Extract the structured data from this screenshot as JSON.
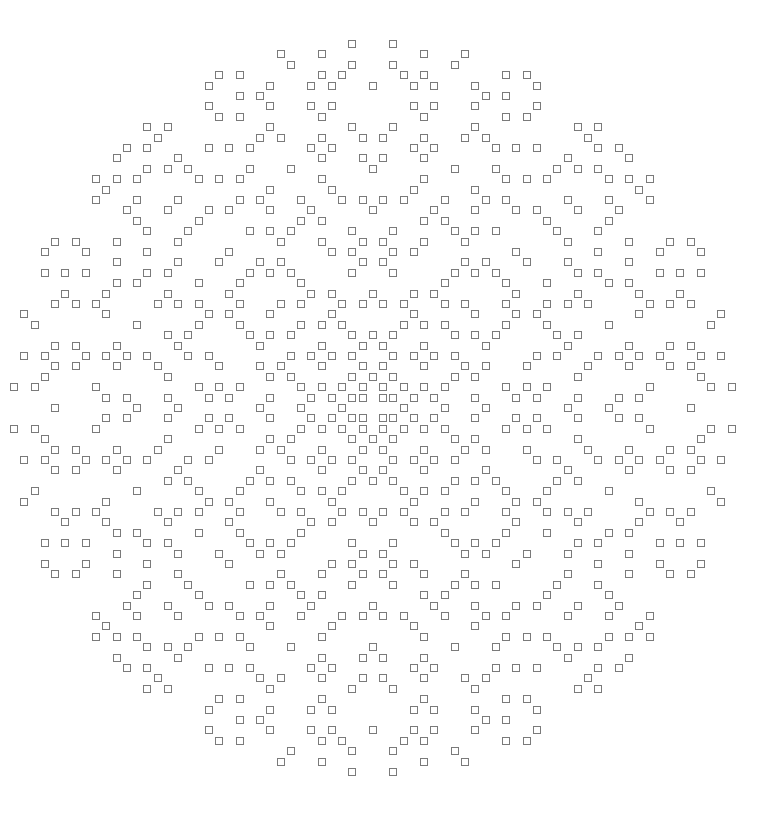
{
  "figure": {
    "type": "symmetric square-cell pattern",
    "symmetry": "four-fold mirror (left-right and top-bottom)",
    "grid": {
      "rows": 71,
      "cols": 71,
      "origin_x": 14,
      "origin_y": 44,
      "col_pitch": 10.25,
      "row_pitch": 10.4,
      "cell_size": 8,
      "center_row": 35,
      "center_col": 35
    },
    "colors": {
      "background": "#ffffff",
      "cell_stroke": "#7a7a7a"
    },
    "top_left_quadrant_cells": {
      "0": [
        33
      ],
      "1": [
        26,
        30
      ],
      "2": [
        27,
        33
      ],
      "3": [
        20,
        22,
        30,
        32
      ],
      "4": [
        19,
        25,
        29,
        31,
        35
      ],
      "5": [
        22,
        24
      ],
      "6": [
        19,
        25,
        29,
        31
      ],
      "7": [
        20,
        22,
        30
      ],
      "8": [
        13,
        15,
        25,
        33
      ],
      "9": [
        14,
        24,
        26,
        30,
        34
      ],
      "10": [
        11,
        13,
        19,
        21,
        23,
        29,
        31
      ],
      "11": [
        10,
        16,
        30,
        34
      ],
      "12": [
        13,
        15,
        17,
        23,
        27,
        35
      ],
      "13": [
        8,
        10,
        12,
        18,
        20,
        22,
        30
      ],
      "14": [
        9,
        25,
        31
      ],
      "15": [
        8,
        12,
        16,
        22,
        24,
        28,
        32,
        34
      ],
      "16": [
        11,
        15,
        19,
        21,
        25,
        29,
        35
      ],
      "17": [
        12,
        18,
        28,
        30
      ],
      "18": [
        13,
        17,
        23,
        25,
        27,
        33
      ],
      "19": [
        4,
        6,
        10,
        16,
        26,
        30,
        34
      ],
      "20": [
        3,
        7,
        13,
        21,
        31,
        33
      ],
      "21": [
        10,
        16,
        20,
        24,
        26,
        34
      ],
      "22": [
        3,
        5,
        7,
        13,
        15,
        23,
        25,
        27,
        33
      ],
      "23": [
        10,
        12,
        18,
        22,
        28
      ],
      "24": [
        5,
        9,
        15,
        21,
        29,
        31,
        35
      ],
      "25": [
        4,
        6,
        8,
        14,
        16,
        18,
        22,
        26,
        28,
        32,
        34
      ],
      "26": [
        1,
        9,
        19,
        21,
        25,
        31
      ],
      "27": [
        2,
        12,
        18,
        22,
        28,
        30,
        32
      ],
      "28": [
        15,
        17,
        23,
        25,
        27,
        33,
        35
      ],
      "29": [
        4,
        6,
        10,
        16,
        24,
        30,
        34
      ],
      "30": [
        1,
        3,
        7,
        9,
        11,
        13,
        17,
        19,
        27,
        29,
        31,
        33
      ],
      "31": [
        4,
        6,
        10,
        14,
        20,
        24,
        26,
        30,
        34
      ],
      "32": [
        3,
        15,
        25,
        27,
        33,
        35
      ],
      "33": [
        0,
        2,
        8,
        18,
        20,
        22,
        28,
        30,
        32,
        34
      ],
      "34": [
        9,
        11,
        15,
        19,
        21,
        25,
        29,
        31,
        33,
        34
      ],
      "35": [
        4,
        12,
        16,
        24,
        28,
        32
      ]
    }
  }
}
